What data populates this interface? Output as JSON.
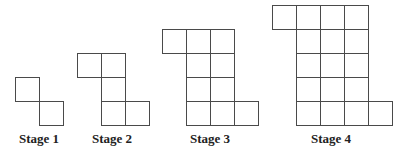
{
  "colors": {
    "stroke": "#4a4a4a",
    "text": "#222222",
    "background": "#ffffff"
  },
  "cell_size": 24,
  "stages": [
    {
      "label": "Stage 1",
      "label_x": 19,
      "origin": [
        15,
        77
      ],
      "cells": [
        [
          0,
          0
        ],
        [
          1,
          1
        ]
      ]
    },
    {
      "label": "Stage 2",
      "label_x": 92,
      "origin": [
        77,
        53
      ],
      "cells": [
        [
          0,
          0
        ],
        [
          1,
          0
        ],
        [
          1,
          1
        ],
        [
          1,
          2
        ],
        [
          2,
          2
        ]
      ]
    },
    {
      "label": "Stage 3",
      "label_x": 190,
      "origin": [
        162,
        29
      ],
      "cells": [
        [
          0,
          0
        ],
        [
          1,
          0
        ],
        [
          2,
          0
        ],
        [
          1,
          1
        ],
        [
          2,
          1
        ],
        [
          1,
          2
        ],
        [
          2,
          2
        ],
        [
          1,
          3
        ],
        [
          2,
          3
        ],
        [
          3,
          3
        ]
      ]
    },
    {
      "label": "Stage 4",
      "label_x": 311,
      "origin": [
        272,
        5
      ],
      "cells": [
        [
          0,
          0
        ],
        [
          1,
          0
        ],
        [
          2,
          0
        ],
        [
          3,
          0
        ],
        [
          1,
          1
        ],
        [
          2,
          1
        ],
        [
          3,
          1
        ],
        [
          1,
          2
        ],
        [
          2,
          2
        ],
        [
          3,
          2
        ],
        [
          1,
          3
        ],
        [
          2,
          3
        ],
        [
          3,
          3
        ],
        [
          1,
          4
        ],
        [
          2,
          4
        ],
        [
          3,
          4
        ],
        [
          4,
          4
        ]
      ]
    }
  ]
}
